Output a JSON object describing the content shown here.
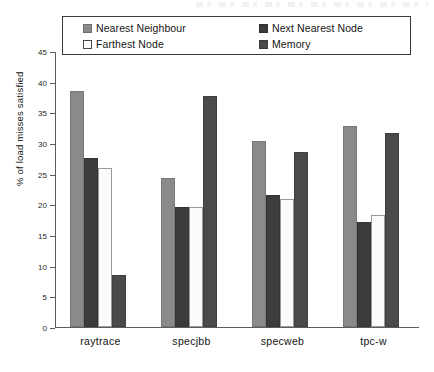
{
  "chart_data": {
    "type": "bar",
    "title": "",
    "xlabel": "",
    "ylabel": "% of load misses satisfied",
    "ylim": [
      0,
      45
    ],
    "yticks": [
      0,
      5,
      10,
      15,
      20,
      25,
      30,
      35,
      40,
      45
    ],
    "grid": false,
    "legend_position": "top",
    "categories": [
      "raytrace",
      "specjbb",
      "specweb",
      "tpc-w"
    ],
    "series": [
      {
        "name": "Nearest Neighbour",
        "color": "#8a8a8a",
        "values": [
          38.5,
          24.3,
          30.3,
          32.8
        ]
      },
      {
        "name": "Next Nearest Node",
        "color": "#3c3c3c",
        "values": [
          27.5,
          19.5,
          21.5,
          17.2
        ]
      },
      {
        "name": "Farthest Node",
        "color": "#fbfbfb",
        "values": [
          26.0,
          19.5,
          20.8,
          18.3
        ]
      },
      {
        "name": "Memory",
        "color": "#4a4a4a",
        "values": [
          8.5,
          37.7,
          28.5,
          31.7
        ]
      }
    ]
  },
  "legend": {
    "entries": [
      {
        "label": "Nearest Neighbour",
        "swatch": "#8a8a8a",
        "border": "#6e6e6e"
      },
      {
        "label": "Farthest Node",
        "swatch": "#fdfdfd",
        "border": "#4a4a4a"
      },
      {
        "label": "Next Nearest Node",
        "swatch": "#3c3c3c",
        "border": "#303030"
      },
      {
        "label": "Memory",
        "swatch": "#4a4a4a",
        "border": "#3d3d3d"
      }
    ]
  },
  "axes": {
    "y_title": "% of load misses satisfied",
    "y_tick_labels": [
      "0",
      "5",
      "10",
      "15",
      "20",
      "25",
      "30",
      "35",
      "40",
      "45"
    ],
    "x_tick_labels": [
      "raytrace",
      "specjbb",
      "specweb",
      "tpc-w"
    ]
  }
}
